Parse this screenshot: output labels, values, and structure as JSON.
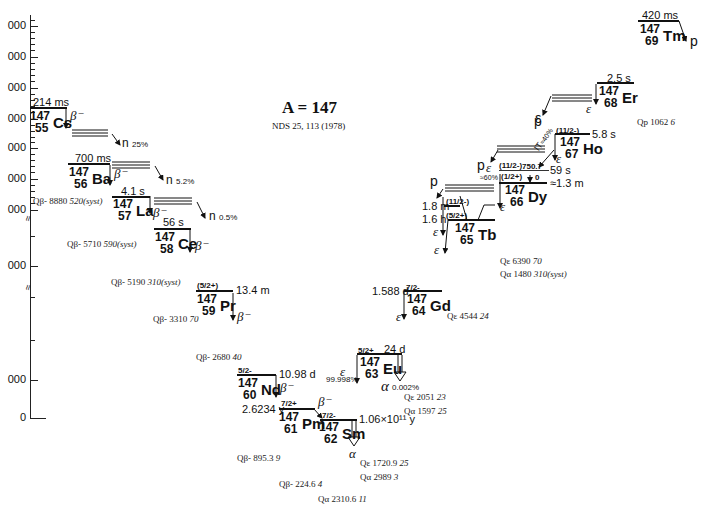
{
  "title": "A = 147",
  "reference": "NDS 25, 113 (1978)",
  "axis": {
    "tick_labels": [
      "000",
      "000",
      "000",
      "000",
      "000",
      "000",
      "000",
      "000",
      "000",
      "0"
    ],
    "break_symbol": "≈"
  },
  "nuclides": [
    {
      "id": "cs",
      "mass": "147",
      "z": "55",
      "symbol": "Cs",
      "half_life": "214 ms",
      "spin": "",
      "decay": "β⁻",
      "branch": "n",
      "branch_pct": "25%"
    },
    {
      "id": "ba",
      "mass": "147",
      "z": "56",
      "symbol": "Ba",
      "half_life": "700 ms",
      "spin": "",
      "decay": "β⁻",
      "branch": "n",
      "branch_pct": "5.2%"
    },
    {
      "id": "la",
      "mass": "147",
      "z": "57",
      "symbol": "La",
      "half_life": "4.1 s",
      "spin": "",
      "decay": "β⁻",
      "branch": "n",
      "branch_pct": "0.5%"
    },
    {
      "id": "ce",
      "mass": "147",
      "z": "58",
      "symbol": "Ce",
      "half_life": "56 s",
      "spin": "",
      "decay": "β⁻"
    },
    {
      "id": "pr",
      "mass": "147",
      "z": "59",
      "symbol": "Pr",
      "half_life": "13.4 m",
      "spin": "(5/2+)",
      "decay": "β⁻"
    },
    {
      "id": "nd",
      "mass": "147",
      "z": "60",
      "symbol": "Nd",
      "half_life": "10.98 d",
      "spin": "5/2-",
      "decay": "β⁻"
    },
    {
      "id": "pm",
      "mass": "147",
      "z": "61",
      "symbol": "Pm",
      "half_life": "2.6234 y",
      "spin": "7/2+",
      "decay": "β⁻"
    },
    {
      "id": "sm",
      "mass": "147",
      "z": "62",
      "symbol": "Sm",
      "half_life": "1.06×10¹¹ y",
      "spin": "7/2-",
      "decay": "α"
    },
    {
      "id": "eu",
      "mass": "147",
      "z": "63",
      "symbol": "Eu",
      "half_life": "24 d",
      "spin": "5/2+",
      "decay": "ε",
      "decay_pct": "99.998%",
      "alpha": "α",
      "alpha_pct": "0.002%"
    },
    {
      "id": "gd",
      "mass": "147",
      "z": "64",
      "symbol": "Gd",
      "half_life": "1.588 d",
      "spin": "7/2-",
      "decay": "ε"
    },
    {
      "id": "tb",
      "mass": "147",
      "z": "65",
      "symbol": "Tb",
      "half_life_1": "1.8 m",
      "half_life_2": "1.6 h",
      "spin_1": "(11/2-)",
      "spin_2": "(5/2+)",
      "decay": "ε",
      "branch": "p"
    },
    {
      "id": "dy",
      "mass": "147",
      "z": "66",
      "symbol": "Dy",
      "half_life_1": "59 s",
      "half_life_2": "≈1.3 m",
      "spin_1": "(11/2-)",
      "spin_2": "(1/2+)",
      "level_1": "750.7",
      "level_2": "0",
      "decay": "ε",
      "decay_pct": "≈60%",
      "it": "IT",
      "it_pct": "≈40%",
      "branch": "p"
    },
    {
      "id": "ho",
      "mass": "147",
      "z": "67",
      "symbol": "Ho",
      "half_life": "5.8 s",
      "spin": "(11/2-)",
      "decay": "ε",
      "branch": "p"
    },
    {
      "id": "er",
      "mass": "147",
      "z": "68",
      "symbol": "Er",
      "half_life": "2.5 s",
      "spin": "",
      "decay": "ε"
    },
    {
      "id": "tm",
      "mass": "147",
      "z": "69",
      "symbol": "Tm",
      "half_life": "420 ms",
      "spin": "",
      "decay": "p"
    }
  ],
  "q_values": [
    {
      "label": "Qβ-",
      "value": "8880",
      "unc": "520(syst)"
    },
    {
      "label": "Qβ-",
      "value": "5710",
      "unc": "590(syst)"
    },
    {
      "label": "Qβ-",
      "value": "5190",
      "unc": "310(syst)"
    },
    {
      "label": "Qβ-",
      "value": "3310",
      "unc": "70"
    },
    {
      "label": "Qβ-",
      "value": "2680",
      "unc": "40"
    },
    {
      "label": "Qβ-",
      "value": "895.3",
      "unc": "9"
    },
    {
      "label": "Qβ-",
      "value": "224.6",
      "unc": "4"
    },
    {
      "label": "Qα",
      "value": "2310.6",
      "unc": "11"
    },
    {
      "label": "Qε",
      "value": "1720.9",
      "unc": "25"
    },
    {
      "label": "Qα",
      "value": "2989",
      "unc": "3"
    },
    {
      "label": "Qε",
      "value": "2051",
      "unc": "23"
    },
    {
      "label": "Qα",
      "value": "1597",
      "unc": "25"
    },
    {
      "label": "Qε",
      "value": "4544",
      "unc": "24"
    },
    {
      "label": "Qε",
      "value": "6390",
      "unc": "70"
    },
    {
      "label": "Qα",
      "value": "1480",
      "unc": "310(syst)"
    },
    {
      "label": "Qp",
      "value": "1062",
      "unc": "6"
    }
  ]
}
